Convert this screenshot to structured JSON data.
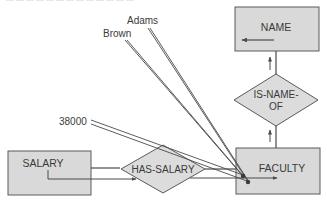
{
  "diagram": {
    "type": "semantic-network",
    "colors": {
      "box_fill": "#d9d9d9",
      "box_stroke": "#5a5a5a",
      "line": "#4a4a4a",
      "text": "#3a3a3a",
      "background": "#ffffff"
    },
    "entities": {
      "name": "NAME",
      "faculty": "FACULTY",
      "salary": "SALARY"
    },
    "relationships": {
      "is_name_of_line1": "IS-NAME-",
      "is_name_of_line2": "OF",
      "has_salary": "HAS-SALARY"
    },
    "values": {
      "adams": "Adams",
      "brown": "Brown",
      "salary_value": "38000"
    },
    "edges": [
      {
        "from": "IS-NAME-OF",
        "to": "NAME"
      },
      {
        "from": "FACULTY",
        "to": "IS-NAME-OF"
      },
      {
        "from": "SALARY",
        "to": "HAS-SALARY"
      },
      {
        "from": "HAS-SALARY",
        "to": "FACULTY"
      },
      {
        "from": "Adams",
        "to": "FACULTY"
      },
      {
        "from": "Brown",
        "to": "FACULTY"
      },
      {
        "from": "38000",
        "to": "FACULTY"
      }
    ]
  }
}
